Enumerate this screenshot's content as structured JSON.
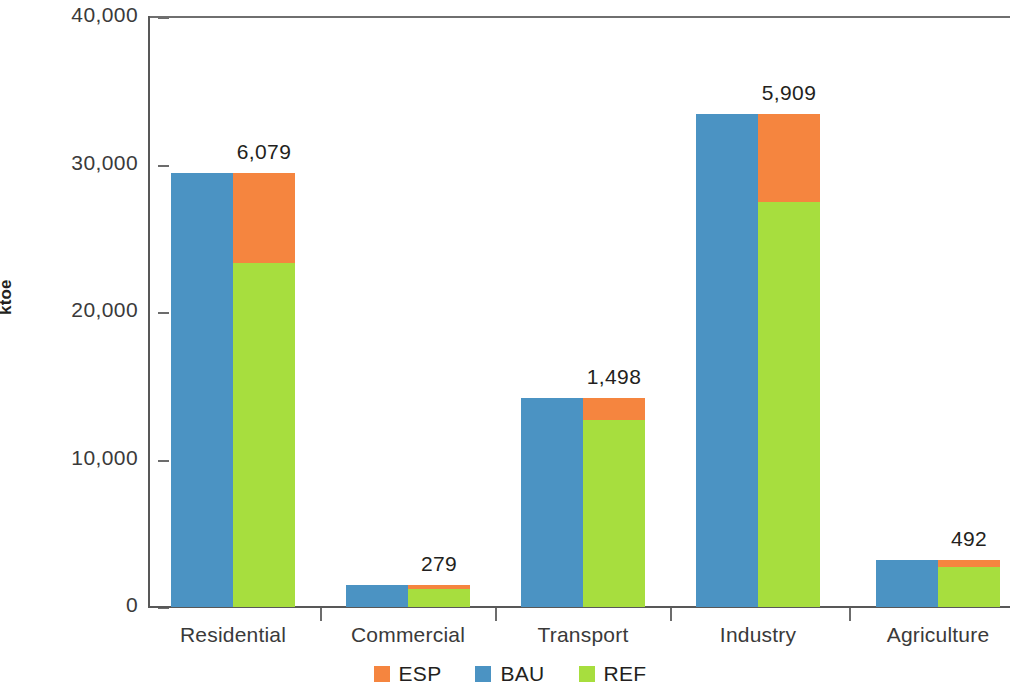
{
  "chart_data": {
    "type": "bar",
    "subtype": "grouped-stacked",
    "title": "",
    "xlabel": "",
    "ylabel": "ktoe",
    "ylim": [
      0,
      40000
    ],
    "ytick_labels": [
      "40,000",
      "30,000",
      "20,000",
      "10,000",
      "0"
    ],
    "ytick_values": [
      40000,
      30000,
      20000,
      10000,
      0
    ],
    "grid": false,
    "legend_position": "bottom-center",
    "categories": [
      "Residential",
      "Commercial",
      "Transport",
      "Industry",
      "Agriculture"
    ],
    "series": [
      {
        "name": "ESP",
        "color": "#f5853f",
        "values": [
          6079,
          279,
          1498,
          5909,
          492
        ]
      },
      {
        "name": "BAU",
        "color": "#4b93c3",
        "values": [
          29400,
          1500,
          14200,
          33400,
          3200
        ]
      },
      {
        "name": "REF",
        "color": "#a7de3e",
        "values": [
          23321,
          1221,
          12702,
          27491,
          2708
        ]
      }
    ],
    "data_labels": [
      "6,079",
      "279",
      "1,498",
      "5,909",
      "492"
    ]
  },
  "legend": {
    "items": [
      {
        "label": "ESP",
        "color": "#f5853f"
      },
      {
        "label": "BAU",
        "color": "#4b93c3"
      },
      {
        "label": "REF",
        "color": "#a7de3e"
      }
    ]
  },
  "axis": {
    "y_title": "ktoe"
  }
}
